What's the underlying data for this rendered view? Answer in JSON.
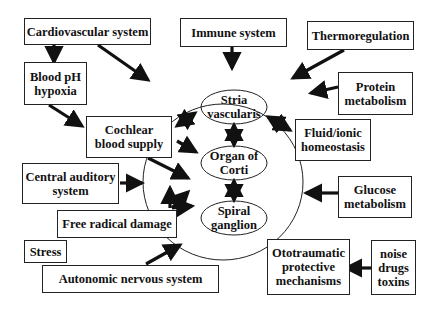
{
  "diagram": {
    "outer_boxes": {
      "cardiovascular": "Cardiovascular system",
      "immune": "Immune system",
      "thermoregulation": "Thermoregulation",
      "blood_ph": "Blood pH\nhypoxia",
      "protein": "Protein\nmetabolism",
      "cochlear_blood": "Cochlear\nblood supply",
      "fluid": "Fluid/ionic\nhomeostasis",
      "central_auditory": "Central auditory\nsystem",
      "glucose": "Glucose\nmetabolism",
      "free_radical": "Free radical damage",
      "stress": "Stress",
      "autonomic": "Autonomic nervous system",
      "ototraumatic": "Ototraumatic\nprotective\nmechanisms",
      "noise": "noise\ndrugs\ntoxins"
    },
    "inner_nodes": {
      "stria": "Stria\nvascularis",
      "corti": "Organ of\nCorti",
      "spiral": "Spiral\nganglion"
    },
    "colors": {
      "line": "#111111",
      "background": "#ffffff"
    }
  }
}
